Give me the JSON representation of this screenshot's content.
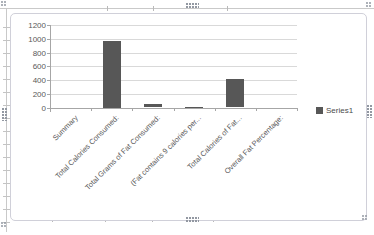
{
  "chart_data": {
    "type": "bar",
    "title": "",
    "categories": [
      "Summary",
      "Total Calories Consumed:",
      "Total Grams of Fat Consumed:",
      "(Fat contains 9 calories per...",
      "Total Calories of Fat...",
      "Overall Fat Percentage:"
    ],
    "series": [
      {
        "name": "Series1",
        "values": [
          0,
          970,
          46,
          9,
          414,
          0
        ]
      }
    ],
    "xlabel": "",
    "ylabel": "",
    "ylim": [
      0,
      1200
    ],
    "ytick_step": 200,
    "ytick_labels": [
      "0",
      "200",
      "400",
      "600",
      "800",
      "1000",
      "1200"
    ],
    "grid": true,
    "legend_position": "right",
    "colors": {
      "bar": "#575757",
      "gridline": "#d9d9d9",
      "axis": "#a6a6a6",
      "label_text": "#595959",
      "chart_border": "#d0d0d9",
      "worksheet_line": "#c9c9c9",
      "selection_handle": "#9096a0"
    }
  },
  "chart_frame": {
    "state": "selected"
  }
}
